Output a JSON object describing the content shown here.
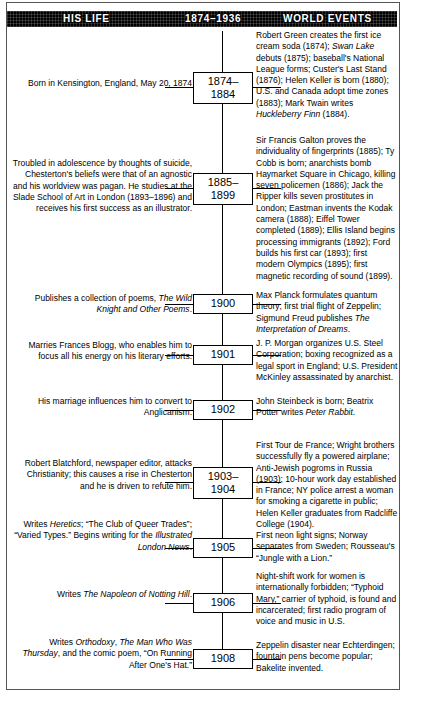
{
  "page": {
    "title": "GILBERT K. CHESTERTON",
    "frame_color": "#555555",
    "header_bg": "#000000",
    "header_fg": "#ffffff"
  },
  "header": {
    "life_label": "HIS LIFE",
    "years_label": "1874–1936",
    "world_label": "WORLD EVENTS"
  },
  "timeline": {
    "rows": [
      {
        "year_line1": "1874–",
        "year_line2": "1884",
        "life": "Born in Kensington, England, May 20, 1874",
        "world": "Robert Green creates the first ice cream soda (1874); Swan Lake debuts (1875); baseball's National League forms; Custer's Last Stand (1876); Helen Keller is born (1880); U.S. and Canada adopt time zones (1883); Mark Twain writes Huckleberry Finn (1884)."
      },
      {
        "year_line1": "1885–",
        "year_line2": "1899",
        "life": "Troubled in adolescence by thoughts of suicide, Chesterton's beliefs were that of an agnostic and his worldview was pagan. He studies at the Slade School of Art in London (1893–1896) and receives his first success as an illustrator.",
        "world": "Sir Francis Galton proves the individuality of fingerprints (1885); Ty Cobb is born; anarchists bomb Haymarket Square in Chicago, killing seven policemen (1886); Jack the Ripper kills seven prostitutes in London; Eastman invents the Kodak camera (1888); Eiffel Tower completed (1889); Ellis Island begins processing immigrants (1892); Ford builds his first car (1893); first modern Olympics (1895); first magnetic recording of sound (1899)."
      },
      {
        "year_line1": "1900",
        "year_line2": "",
        "life": "Publishes a collection of poems, The Wild Knight and Other Poems.",
        "world": "Max Planck formulates quantum theory; first trial flight of Zeppelin; Sigmund Freud publishes The Interpretation of Dreams."
      },
      {
        "year_line1": "1901",
        "year_line2": "",
        "life": "Marries Frances Blogg, who enables him to focus all his energy on his literary efforts.",
        "world": "J. P. Morgan organizes U.S. Steel Corporation; boxing recognized as a legal sport in England; U.S. President McKinley assassinated by anarchist."
      },
      {
        "year_line1": "1902",
        "year_line2": "",
        "life": "His marriage influences him to convert to Anglicanism.",
        "world": "John Steinbeck is born; Beatrix Potter writes Peter Rabbit."
      },
      {
        "year_line1": "1903–",
        "year_line2": "1904",
        "life": "Robert Blatchford, newspaper editor, attacks Christianity; this causes a rise in Chesterton and he is driven to refute him.",
        "world": "First Tour de France; Wright brothers successfully fly a powered airplane; Anti-Jewish pogroms in Russia (1903); 10-hour work day established in France; NY police arrest a woman for smoking a cigarette in public; Helen Keller graduates from Radcliffe College (1904)."
      },
      {
        "year_line1": "1905",
        "year_line2": "",
        "life": "Writes Heretics; “The Club of Queer Trades”; “Varied Types.” Begins writing for the Illustrated London News.",
        "world": "First neon light signs; Norway separates from Sweden; Rousseau's “Jungle with a Lion.”"
      },
      {
        "year_line1": "1906",
        "year_line2": "",
        "life": "Writes The Napoleon of Notting Hill.",
        "world": "Night-shift work for women is internationally forbidden; “Typhoid Mary,” carrier of typhoid, is found and incarcerated; first radio program of voice and music in U.S."
      },
      {
        "year_line1": "1908",
        "year_line2": "",
        "life": "Writes Orthodoxy, The Man Who Was Thursday, and the comic poem, “On Running After One's Hat.”",
        "world": "Zeppelin disaster near Echterdingen; fountain pens become popular; Bakelite invented."
      }
    ]
  }
}
